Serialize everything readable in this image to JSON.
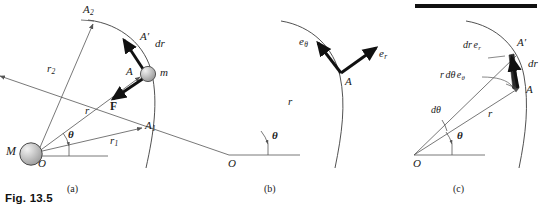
{
  "figure": {
    "caption": "Fig. 13.5",
    "panels": [
      {
        "id": "a",
        "label": "(a)"
      },
      {
        "id": "b",
        "label": "(b)"
      },
      {
        "id": "c",
        "label": "(c)"
      }
    ]
  },
  "panel_a": {
    "labels": {
      "big_mass": "M",
      "origin": "O",
      "small_mass": "m",
      "point_A": "A",
      "point_A_prime": "A′",
      "point_A1": "A",
      "point_A1_sub": "1",
      "point_A2": "A",
      "point_A2_sub": "2",
      "radius_r": "r",
      "radius_r1": "r",
      "radius_r1_sub": "1",
      "radius_r2": "r",
      "radius_r2_sub": "2",
      "angle_theta": "θ",
      "vector_dr_d": "d",
      "vector_dr_r": "r",
      "vector_F": "F"
    }
  },
  "panel_b": {
    "labels": {
      "origin": "O",
      "point_A": "A",
      "radius_r": "r",
      "angle_theta": "θ",
      "unit_e_theta_e": "e",
      "unit_e_theta_sub": "θ",
      "unit_e_r_e": "e",
      "unit_e_r_sub": "r"
    }
  },
  "panel_c": {
    "labels": {
      "origin": "O",
      "point_A": "A",
      "point_A_prime": "A′",
      "radius_r": "r",
      "angle_theta": "θ",
      "angle_dtheta_d": "d",
      "angle_dtheta_t": "θ",
      "comp_dr_er_d": "d",
      "comp_dr_er_r": "r",
      "comp_dr_er_e": "e",
      "comp_dr_er_sub": "r",
      "comp_rdtheta_r": "r",
      "comp_rdtheta_d": "d",
      "comp_rdtheta_theta": "θ",
      "comp_rdtheta_e": "e",
      "comp_rdtheta_sub": "θ",
      "vector_dr_d": "d",
      "vector_dr_r": "r"
    }
  },
  "style": {
    "ink": "#1a1a1a",
    "thin_line": "#555555",
    "bold_vector": "#111111",
    "sphere_fill": "#b9b9b9",
    "sphere_edge": "#4a4a4a",
    "sphere_highlight": "#efefef",
    "background": "#ffffff",
    "bar_color": "#111111"
  }
}
